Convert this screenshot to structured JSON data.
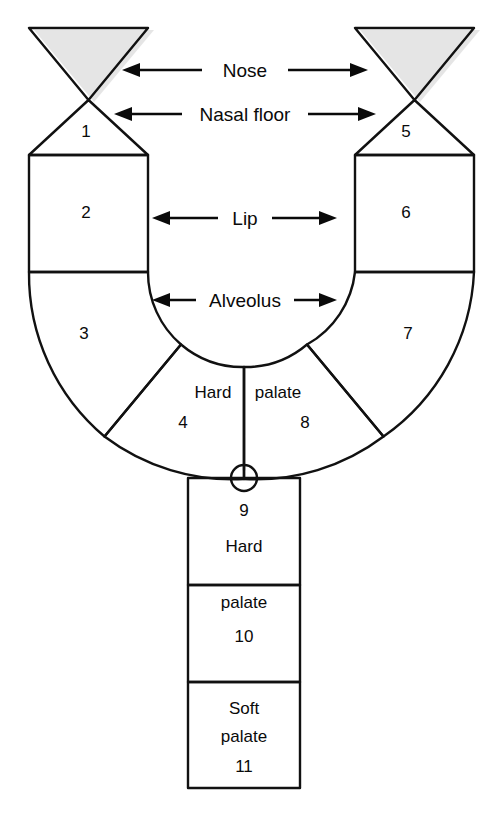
{
  "diagram": {
    "type": "anatomical-schematic",
    "colors": {
      "nose_light": "#e9e9e9",
      "segment_gray": "#adadad",
      "segment_light_gray": "#b6b6b6",
      "hard_palate_dark": "#9a9a9a",
      "segment_white": "#f2f2f2",
      "outline": "#111111",
      "text": "#0a0a0a",
      "background": "#ffffff"
    }
  },
  "arrow_labels": [
    {
      "id": "nose",
      "text": "Nose"
    },
    {
      "id": "nasal-floor",
      "text": "Nasal floor"
    },
    {
      "id": "lip",
      "text": "Lip"
    },
    {
      "id": "alveolus",
      "text": "Alveolus"
    }
  ],
  "segments": [
    {
      "id": 1,
      "number": "1",
      "words": [],
      "side": "left",
      "region": "nasal-floor"
    },
    {
      "id": 2,
      "number": "2",
      "words": [],
      "side": "left",
      "region": "lip"
    },
    {
      "id": 3,
      "number": "3",
      "words": [],
      "side": "left",
      "region": "alveolus"
    },
    {
      "id": 4,
      "number": "4",
      "words": [
        "Hard"
      ],
      "side": "left",
      "region": "hard-palate"
    },
    {
      "id": 5,
      "number": "5",
      "words": [],
      "side": "right",
      "region": "nasal-floor"
    },
    {
      "id": 6,
      "number": "6",
      "words": [],
      "side": "right",
      "region": "lip"
    },
    {
      "id": 7,
      "number": "7",
      "words": [],
      "side": "right",
      "region": "alveolus"
    },
    {
      "id": 8,
      "number": "8",
      "words": [
        "palate"
      ],
      "side": "right",
      "region": "hard-palate"
    },
    {
      "id": 9,
      "number": "9",
      "words": [
        "Hard"
      ],
      "side": "center",
      "region": "hard-palate"
    },
    {
      "id": 10,
      "number": "10",
      "words": [
        "palate"
      ],
      "side": "center",
      "region": "hard-palate"
    },
    {
      "id": 11,
      "number": "11",
      "words": [
        "Soft",
        "palate"
      ],
      "side": "center",
      "region": "soft-palate"
    }
  ],
  "labels": {
    "n1": "1",
    "n2": "2",
    "n3": "3",
    "n4": "4",
    "n5": "5",
    "n6": "6",
    "n7": "7",
    "n8": "8",
    "n9": "9",
    "n10": "10",
    "n11": "11",
    "hard_left": "Hard",
    "palate_right": "palate",
    "hard_9": "Hard",
    "palate_10": "palate",
    "soft_11a": "Soft",
    "soft_11b": "palate"
  }
}
